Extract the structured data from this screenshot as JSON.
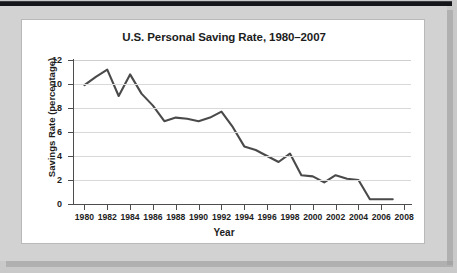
{
  "figure": {
    "title": "U.S. Personal Saving Rate, 1980–2007",
    "xtitle": "Year",
    "ytitle": "Savings Rate (percentage)",
    "line_color": "#4a4a4a",
    "grid_color": "#d9d9d9",
    "axis_color": "#4d4d4d",
    "panel_color": "#ffffff",
    "mat_color": "#d2d2d2"
  },
  "chart_data": {
    "type": "line",
    "title": "U.S. Personal Saving Rate, 1980–2007",
    "xlabel": "Year",
    "ylabel": "Savings Rate (percentage)",
    "xlim": [
      1979,
      2008.6
    ],
    "ylim": [
      0,
      12
    ],
    "grid": true,
    "legend": "none",
    "ytick_labels": [
      "0",
      "2",
      "4",
      "6",
      "8",
      "10",
      "12"
    ],
    "yticks": [
      0,
      2,
      4,
      6,
      8,
      10,
      12
    ],
    "xtick_labels": [
      "1980",
      "1982",
      "1984",
      "1986",
      "1988",
      "1990",
      "1992",
      "1994",
      "1996",
      "1998",
      "2000",
      "2002",
      "2004",
      "2006",
      "2008"
    ],
    "xticks": [
      1980,
      1982,
      1984,
      1986,
      1988,
      1990,
      1992,
      1994,
      1996,
      1998,
      2000,
      2002,
      2004,
      2006,
      2008
    ],
    "x": [
      1980,
      1981,
      1982,
      1983,
      1984,
      1985,
      1986,
      1987,
      1988,
      1989,
      1990,
      1991,
      1992,
      1993,
      1994,
      1995,
      1996,
      1997,
      1998,
      1999,
      2000,
      2001,
      2002,
      2003,
      2004,
      2005,
      2006,
      2007
    ],
    "values": [
      9.9,
      10.6,
      11.2,
      9.0,
      10.8,
      9.2,
      8.2,
      6.9,
      7.2,
      7.1,
      6.9,
      7.2,
      7.7,
      6.4,
      4.8,
      4.5,
      4.0,
      3.5,
      4.2,
      2.4,
      2.3,
      1.8,
      2.4,
      2.1,
      2.0,
      0.4,
      0.4,
      0.4
    ],
    "series": [
      {
        "name": "U.S. Personal Saving Rate",
        "values": [
          9.9,
          10.6,
          11.2,
          9.0,
          10.8,
          9.2,
          8.2,
          6.9,
          7.2,
          7.1,
          6.9,
          7.2,
          7.7,
          6.4,
          4.8,
          4.5,
          4.0,
          3.5,
          4.2,
          2.4,
          2.3,
          1.8,
          2.4,
          2.1,
          2.0,
          0.4,
          0.4,
          0.4
        ]
      }
    ]
  }
}
